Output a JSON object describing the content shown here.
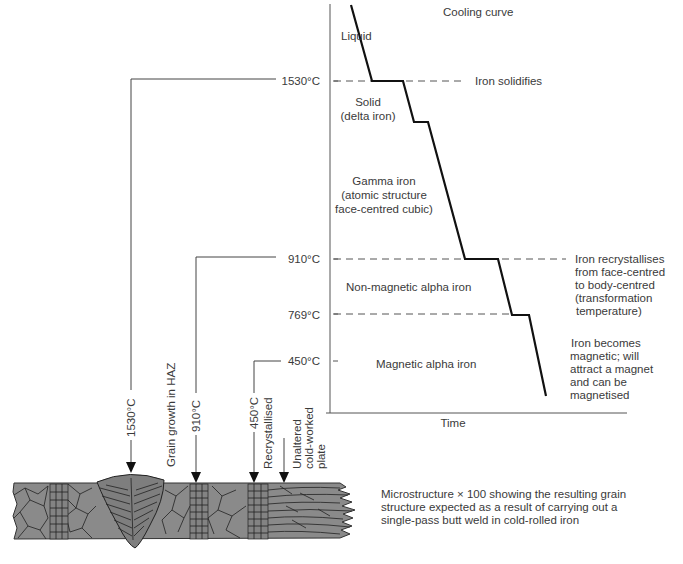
{
  "title": "Cooling curve",
  "phases": {
    "liquid": "Liquid",
    "solid_1": "Solid",
    "solid_2": "(delta iron)",
    "gamma_1": "Gamma iron",
    "gamma_2": "(atomic structure",
    "gamma_3": "face-centred cubic)",
    "nonmag": "Non-magnetic alpha iron",
    "mag": "Magnetic alpha iron"
  },
  "axis": {
    "x_label": "Time"
  },
  "temperatures": {
    "t1530": "1530°C",
    "t910": "910°C",
    "t769": "769°C",
    "t450": "450°C"
  },
  "annotations": {
    "solidifies": "Iron solidifies",
    "recryst_1": "Iron recrystallises",
    "recryst_2": "from face-centred",
    "recryst_3": "to body-centred",
    "recryst_4": "(transformation",
    "recryst_5": "temperature)",
    "magnetic_1": "Iron becomes",
    "magnetic_2": "magnetic; will",
    "magnetic_3": "attract a magnet",
    "magnetic_4": "and can be",
    "magnetic_5": "magnetised"
  },
  "weld_labels": {
    "w1530": "1530°C",
    "grain_growth": "Grain growth in HAZ",
    "w910": "910°C",
    "w450": "450°C",
    "recrystallised": "Recrystallised",
    "unaltered_1": "Unaltered",
    "unaltered_2": "cold-worked",
    "unaltered_3": "plate"
  },
  "caption": {
    "line1": "Microstructure × 100 showing the resulting grain",
    "line2": "structure expected as a result of carrying out a",
    "line3": "single-pass butt weld in cold-rolled iron"
  },
  "colors": {
    "plate": "#8a8a8a",
    "curve": "#111111",
    "text": "#3a3a3a"
  }
}
